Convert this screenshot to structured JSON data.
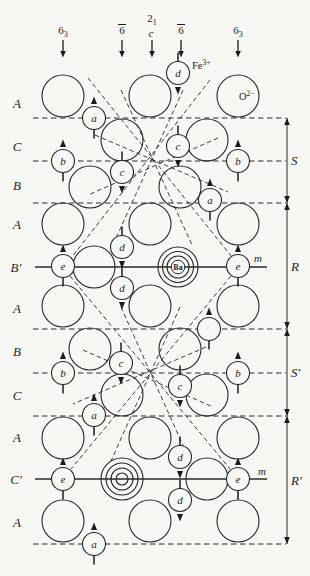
{
  "legend": {
    "fe": {
      "symbol": "Fe",
      "charge": "3+"
    },
    "o": {
      "symbol": "O",
      "charge": "2−"
    },
    "ba_label": "Ba",
    "mirror_label": "m"
  },
  "symmetry_axes": [
    {
      "base": "6",
      "sub": "3",
      "bar": false,
      "below": "",
      "x": 63
    },
    {
      "base": "6",
      "sub": "",
      "bar": true,
      "below": "",
      "x": 122
    },
    {
      "base": "2",
      "sub": "1",
      "bar": false,
      "below": "c",
      "x": 152
    },
    {
      "base": "6",
      "sub": "",
      "bar": true,
      "below": "",
      "x": 181
    },
    {
      "base": "6",
      "sub": "3",
      "bar": false,
      "below": "",
      "x": 238
    }
  ],
  "layer_labels": [
    "A",
    "C",
    "B",
    "A",
    "B′",
    "A",
    "B",
    "C",
    "A",
    "C′",
    "A"
  ],
  "blocks": [
    {
      "label": "S",
      "y1": 118,
      "y2": 203
    },
    {
      "label": "R",
      "y1": 203,
      "y2": 329
    },
    {
      "label": "S′",
      "y1": 329,
      "y2": 416
    },
    {
      "label": "R′",
      "y1": 416,
      "y2": 544
    }
  ],
  "layer_lines": {
    "dashed_y": [
      118,
      161,
      203,
      329,
      373,
      416,
      544
    ],
    "solid": [
      {
        "y": 267,
        "x1": 35,
        "x2": 267
      },
      {
        "y": 479,
        "x1": 35,
        "x2": 267
      }
    ]
  },
  "oxygen_ions": [
    {
      "x": 63,
      "y": 96
    },
    {
      "x": 150,
      "y": 96
    },
    {
      "x": 238,
      "y": 96
    },
    {
      "x": 122,
      "y": 140
    },
    {
      "x": 207,
      "y": 140
    },
    {
      "x": 90,
      "y": 187
    },
    {
      "x": 180,
      "y": 187
    },
    {
      "x": 63,
      "y": 224
    },
    {
      "x": 150,
      "y": 224
    },
    {
      "x": 238,
      "y": 224
    },
    {
      "x": 94,
      "y": 267
    },
    {
      "x": 63,
      "y": 306
    },
    {
      "x": 150,
      "y": 306
    },
    {
      "x": 238,
      "y": 306
    },
    {
      "x": 90,
      "y": 349
    },
    {
      "x": 180,
      "y": 349
    },
    {
      "x": 122,
      "y": 395
    },
    {
      "x": 207,
      "y": 395
    },
    {
      "x": 63,
      "y": 438
    },
    {
      "x": 150,
      "y": 438
    },
    {
      "x": 238,
      "y": 438
    },
    {
      "x": 207,
      "y": 479
    },
    {
      "x": 63,
      "y": 521
    },
    {
      "x": 150,
      "y": 521
    },
    {
      "x": 238,
      "y": 521
    }
  ],
  "ba_ions": [
    {
      "x": 178,
      "y": 267,
      "show_label": true
    },
    {
      "x": 122,
      "y": 479,
      "show_label": false
    }
  ],
  "fe_sites": [
    {
      "label": "d",
      "x": 178,
      "y": 73,
      "spin": "down"
    },
    {
      "label": "a",
      "x": 94,
      "y": 118,
      "spin": "up"
    },
    {
      "label": "c",
      "x": 178,
      "y": 146,
      "spin": "down"
    },
    {
      "label": "b",
      "x": 63,
      "y": 161,
      "spin": "up"
    },
    {
      "label": "b",
      "x": 238,
      "y": 161,
      "spin": "up"
    },
    {
      "label": "c",
      "x": 122,
      "y": 172,
      "spin": "down"
    },
    {
      "label": "a",
      "x": 210,
      "y": 200,
      "spin": "up"
    },
    {
      "label": "d",
      "x": 122,
      "y": 247,
      "spin": "down"
    },
    {
      "label": "e",
      "x": 63,
      "y": 266,
      "spin": "up"
    },
    {
      "label": "e",
      "x": 238,
      "y": 266,
      "spin": "up"
    },
    {
      "label": "d",
      "x": 122,
      "y": 288,
      "spin": "down"
    },
    {
      "label": "",
      "x": 209,
      "y": 329,
      "spin": "up"
    },
    {
      "label": "c",
      "x": 121,
      "y": 363,
      "spin": "down"
    },
    {
      "label": "b",
      "x": 63,
      "y": 373,
      "spin": "up"
    },
    {
      "label": "b",
      "x": 238,
      "y": 373,
      "spin": "up"
    },
    {
      "label": "c",
      "x": 180,
      "y": 386,
      "spin": "down"
    },
    {
      "label": "a",
      "x": 94,
      "y": 415,
      "spin": "up"
    },
    {
      "label": "d",
      "x": 180,
      "y": 457,
      "spin": "down"
    },
    {
      "label": "e",
      "x": 63,
      "y": 479,
      "spin": "up"
    },
    {
      "label": "e",
      "x": 238,
      "y": 479,
      "spin": "up"
    },
    {
      "label": "d",
      "x": 180,
      "y": 500,
      "spin": "down"
    },
    {
      "label": "a",
      "x": 94,
      "y": 544,
      "spin": "up"
    }
  ],
  "diagonals": [
    [
      88,
      78,
      236,
      262
    ],
    [
      210,
      80,
      68,
      262
    ],
    [
      183,
      90,
      112,
      247
    ],
    [
      121,
      90,
      193,
      247
    ],
    [
      95,
      135,
      228,
      192
    ],
    [
      218,
      138,
      88,
      195
    ],
    [
      231,
      276,
      71,
      469
    ],
    [
      70,
      276,
      230,
      469
    ],
    [
      121,
      307,
      190,
      461
    ],
    [
      180,
      307,
      111,
      461
    ],
    [
      206,
      347,
      73,
      404
    ],
    [
      83,
      350,
      213,
      407
    ]
  ],
  "colors": {
    "ink": "#1e1e1e",
    "paper": "#f7f7f4"
  }
}
